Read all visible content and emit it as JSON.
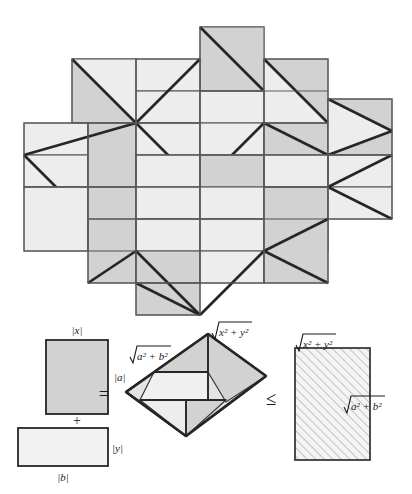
{
  "figure": {
    "colors": {
      "shade_dark": "#d2d2d2",
      "shade_light": "#ededed",
      "outline": "#5a5a5a",
      "heavy_line": "#262626",
      "hatch": "#9a9a9a",
      "background": "#ffffff"
    }
  },
  "tessellation": {
    "name": "pinwheel-tiling",
    "unit_square": 64,
    "description": "Repeating pinwheel of four congruent right triangles and rectangles"
  },
  "equation": {
    "left": {
      "rect_top": {
        "label_top": "|x|",
        "label_right": "|a|"
      },
      "plus_sign": "+",
      "rect_bottom": {
        "label_bottom": "|b|",
        "label_right": "|y|"
      }
    },
    "equals_sign": "=",
    "middle": {
      "label_upper_left": "√a² + b²",
      "label_upper_left_radicand": "a² + b²",
      "label_top_right": "√x² + y²",
      "label_top_right_radicand": "x² + y²",
      "shape": "parallelogram"
    },
    "leq_sign": "≤",
    "right": {
      "label_top": "√x² + y²",
      "label_top_radicand": "x² + y²",
      "label_right": "√a² + b²",
      "label_right_radicand": "a² + b²",
      "fill": "diagonal-hatch"
    }
  }
}
